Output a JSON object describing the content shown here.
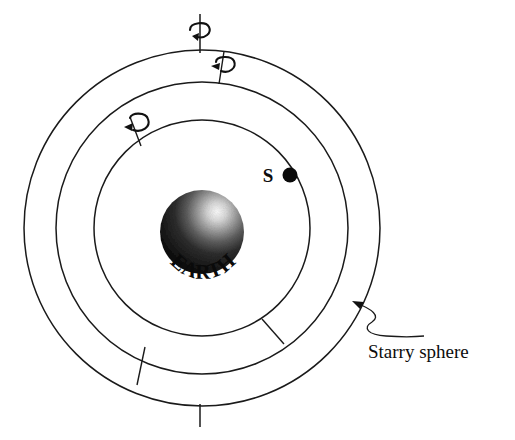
{
  "diagram": {
    "center_body": {
      "name": "earth-sphere",
      "label": "EARTH",
      "cx": 202,
      "cy": 232,
      "r": 42,
      "shade_dark": "#111111",
      "shade_light": "#f2f2f2"
    },
    "star": {
      "label": "S",
      "dot_x": 290,
      "dot_y": 175,
      "dot_r": 7.5,
      "label_x": 268,
      "label_y": 182,
      "color": "#0a0a0a"
    },
    "spheres": [
      {
        "name": "inner-sphere",
        "cx": 202,
        "cy": 228,
        "r": 108
      },
      {
        "name": "middle-sphere",
        "cx": 202,
        "cy": 228,
        "r": 146
      },
      {
        "name": "outer-sphere",
        "cx": 202,
        "cy": 228,
        "r": 178
      }
    ],
    "rotation_markers": [
      {
        "name": "outer-sphere-rotation-axis",
        "angle_deg": 90,
        "direction": "counterclockwise"
      },
      {
        "name": "middle-sphere-rotation-axis",
        "angle_deg": 73,
        "direction": "counterclockwise"
      },
      {
        "name": "inner-sphere-rotation-axis",
        "angle_deg": 131,
        "direction": "counterclockwise"
      }
    ],
    "callout": {
      "label": "Starry sphere",
      "text_x": 368,
      "text_y": 358,
      "arrow_target_x": 352,
      "arrow_target_y": 302
    },
    "stroke_color": "#1a1a1a",
    "background_color": "#ffffff"
  }
}
